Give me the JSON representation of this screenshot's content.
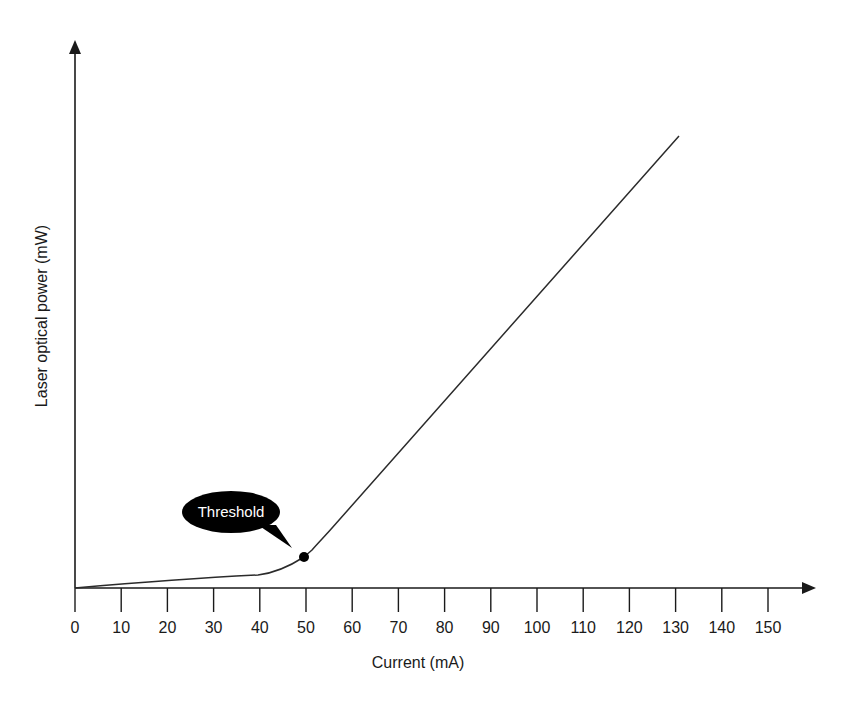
{
  "chart_data": {
    "type": "line",
    "title": "",
    "xlabel": "Current (mA)",
    "ylabel": "Laser optical power (mW)",
    "xlim": [
      0,
      150
    ],
    "x_ticks": [
      0,
      10,
      20,
      30,
      40,
      50,
      60,
      70,
      80,
      90,
      100,
      110,
      120,
      130,
      140,
      150
    ],
    "y_ticks": [],
    "grid": false,
    "legend": null,
    "series": [
      {
        "name": "L-I curve",
        "x": [
          0,
          10,
          20,
          30,
          40,
          45,
          50,
          55,
          60,
          70,
          80,
          90,
          100,
          110,
          120,
          130
        ],
        "y_relative": [
          0,
          0.7,
          1.5,
          2.2,
          2.9,
          4.0,
          6.8,
          11.8,
          18.0,
          30.6,
          43.2,
          55.8,
          68.4,
          81.0,
          93.6,
          100
        ]
      }
    ],
    "annotations": [
      {
        "text": "Threshold",
        "x": 50,
        "type": "callout-with-marker"
      }
    ]
  },
  "axes": {
    "x_label": "Current (mA)",
    "y_label": "Laser optical power (mW)",
    "x_tick_labels": [
      "0",
      "10",
      "20",
      "30",
      "40",
      "50",
      "60",
      "70",
      "80",
      "90",
      "100",
      "110",
      "120",
      "130",
      "140",
      "150"
    ]
  },
  "annotation": {
    "label": "Threshold"
  },
  "colors": {
    "line": "#2b2b2b",
    "axis": "#1a1a1a",
    "callout": "#000000",
    "callout_text": "#ffffff"
  }
}
